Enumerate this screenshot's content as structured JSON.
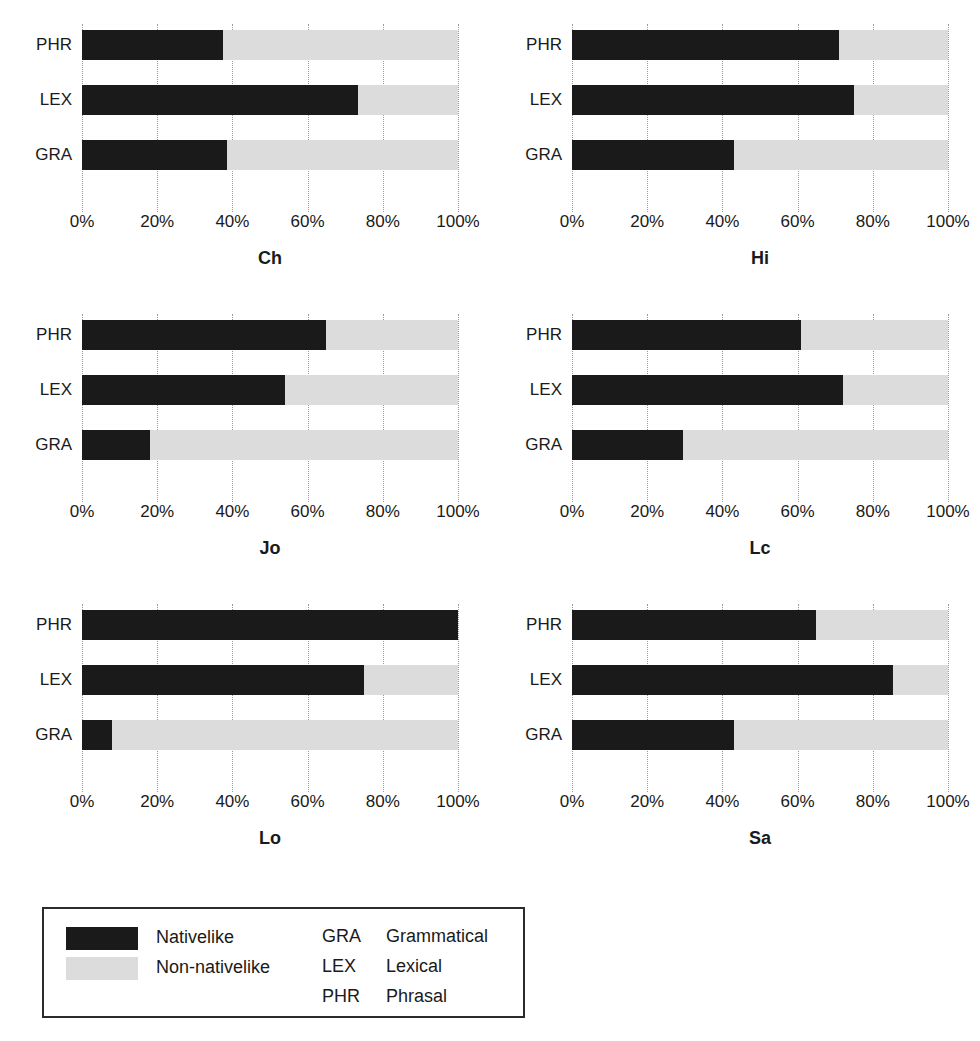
{
  "chart_data": {
    "type": "bar",
    "title": "",
    "subtitle": "",
    "xlabel": "",
    "ylabel": "",
    "orientation": "horizontal",
    "stacked": true,
    "stack_total": 100,
    "xlim": [
      0,
      100
    ],
    "xticks": [
      0,
      20,
      40,
      60,
      80,
      100
    ],
    "xtick_labels": [
      "0%",
      "20%",
      "40%",
      "60%",
      "80%",
      "100%"
    ],
    "grid": "vertical-dotted",
    "legend_position": "bottom-left",
    "categories": [
      "PHR",
      "LEX",
      "GRA"
    ],
    "category_order_top_to_bottom": [
      "PHR",
      "LEX",
      "GRA"
    ],
    "series": [
      {
        "name": "Nativelike",
        "color": "#1a1a1a"
      },
      {
        "name": "Non-nativelike",
        "color": "#dcdcdc"
      }
    ],
    "panels": [
      {
        "name": "Ch",
        "rows": [
          {
            "category": "PHR",
            "nativelike": 37.5,
            "non_nativelike": 62.5
          },
          {
            "category": "LEX",
            "nativelike": 73.5,
            "non_nativelike": 26.5
          },
          {
            "category": "GRA",
            "nativelike": 38.5,
            "non_nativelike": 61.5
          }
        ]
      },
      {
        "name": "Hi",
        "rows": [
          {
            "category": "PHR",
            "nativelike": 71.0,
            "non_nativelike": 29.0
          },
          {
            "category": "LEX",
            "nativelike": 75.0,
            "non_nativelike": 25.0
          },
          {
            "category": "GRA",
            "nativelike": 43.0,
            "non_nativelike": 57.0
          }
        ]
      },
      {
        "name": "Jo",
        "rows": [
          {
            "category": "PHR",
            "nativelike": 65.0,
            "non_nativelike": 35.0
          },
          {
            "category": "LEX",
            "nativelike": 54.0,
            "non_nativelike": 46.0
          },
          {
            "category": "GRA",
            "nativelike": 18.0,
            "non_nativelike": 82.0
          }
        ]
      },
      {
        "name": "Lc",
        "rows": [
          {
            "category": "PHR",
            "nativelike": 61.0,
            "non_nativelike": 39.0
          },
          {
            "category": "LEX",
            "nativelike": 72.0,
            "non_nativelike": 28.0
          },
          {
            "category": "GRA",
            "nativelike": 29.5,
            "non_nativelike": 70.5
          }
        ]
      },
      {
        "name": "Lo",
        "rows": [
          {
            "category": "PHR",
            "nativelike": 100.0,
            "non_nativelike": 0.0
          },
          {
            "category": "LEX",
            "nativelike": 75.0,
            "non_nativelike": 25.0
          },
          {
            "category": "GRA",
            "nativelike": 8.0,
            "non_nativelike": 92.0
          }
        ]
      },
      {
        "name": "Sa",
        "rows": [
          {
            "category": "PHR",
            "nativelike": 65.0,
            "non_nativelike": 35.0
          },
          {
            "category": "LEX",
            "nativelike": 85.5,
            "non_nativelike": 14.5
          },
          {
            "category": "GRA",
            "nativelike": 43.0,
            "non_nativelike": 57.0
          }
        ]
      }
    ]
  },
  "legend": {
    "series": [
      {
        "label": "Nativelike",
        "color": "#1a1a1a"
      },
      {
        "label": "Non-nativelike",
        "color": "#dcdcdc"
      }
    ],
    "abbreviations": [
      {
        "code": "GRA",
        "full": "Grammatical"
      },
      {
        "code": "LEX",
        "full": "Lexical"
      },
      {
        "code": "PHR",
        "full": "Phrasal"
      }
    ]
  }
}
